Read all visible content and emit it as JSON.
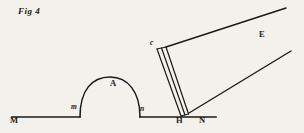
{
  "figure": {
    "caption": "Fig 4",
    "paper_color": "#f3f1ec",
    "ink_color": "#1a1a18",
    "width": 304,
    "height": 133
  },
  "labels": {
    "fig": "Fig  4",
    "ground_left": "M",
    "mound_left_foot": "m",
    "mound_apex": "A",
    "mound_right_foot": "n",
    "pivot": "H",
    "ground_right": "N",
    "rod_top": "c",
    "beam": "E"
  },
  "geometry": {
    "ground_line_y": 117,
    "ground_left_x": 12,
    "ground_right_x": 216,
    "mound_left_foot_x": 80,
    "mound_right_foot_x": 140,
    "mound_apex_x": 113,
    "mound_apex_y": 88,
    "pivot_x": 184,
    "pivot_y": 117,
    "rod_top_x": 158,
    "rod_top_y": 48,
    "beam_upper_end_x": 286,
    "beam_upper_end_y": 8,
    "beam_lower_end_x": 291,
    "beam_lower_end_y": 51
  }
}
